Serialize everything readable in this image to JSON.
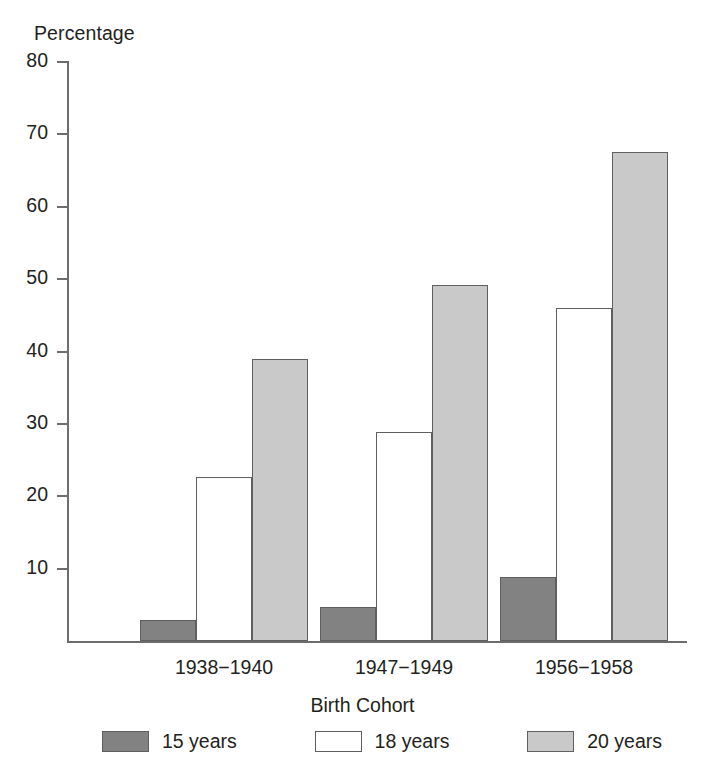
{
  "chart_data": {
    "type": "bar",
    "title": "",
    "xlabel": "Birth Cohort",
    "ylabel": "Percentage",
    "categories": [
      "1938−1940",
      "1947−1949",
      "1956−1958"
    ],
    "series": [
      {
        "name": "15 years",
        "values": [
          2.9,
          4.7,
          8.8
        ],
        "color": "#828282"
      },
      {
        "name": "18 years",
        "values": [
          22.6,
          28.9,
          46.0
        ],
        "color": "#ffffff"
      },
      {
        "name": "20 years",
        "values": [
          39.0,
          49.2,
          67.5
        ],
        "color": "#c9c9c9"
      }
    ],
    "ylim": [
      0,
      80
    ],
    "yticks": [
      10,
      20,
      30,
      40,
      50,
      60,
      70,
      80
    ],
    "ytick_labels": [
      "10",
      "20",
      "30",
      "40",
      "50",
      "60",
      "70",
      "80"
    ],
    "grid": false,
    "legend_position": "bottom"
  },
  "axis": {
    "y_title": "Percentage",
    "x_title": "Birth Cohort"
  },
  "colors": {
    "axis": "#6d6d6d",
    "bar_border": "#5f5f5f",
    "text": "#231f20"
  }
}
